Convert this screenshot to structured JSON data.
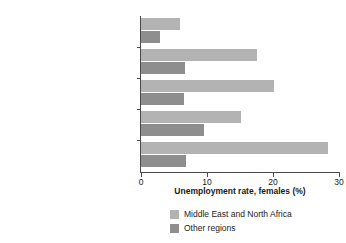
{
  "chart_data": {
    "type": "bar",
    "orientation": "horizontal",
    "title": "",
    "xlabel": "Unemployment rate, females (%)",
    "ylabel": "",
    "xlim": [
      0,
      30
    ],
    "xticks": [
      0,
      10,
      20,
      30
    ],
    "xtick_labels": [
      "0",
      "10",
      "20",
      "30"
    ],
    "grid": false,
    "legend_position": "bottom",
    "categories": [
      "No education",
      "Primary incomplete",
      "Primary complete",
      "Secondary complete",
      "Some tertiary or postsecondary"
    ],
    "series": [
      {
        "name": "Middle East and North Africa",
        "color": "#b3b3b3",
        "values": [
          5.9,
          17.6,
          20.2,
          15.1,
          28.4
        ]
      },
      {
        "name": "Other regions",
        "color": "#8e8e8e",
        "values": [
          2.9,
          6.7,
          6.5,
          9.5,
          6.8
        ]
      }
    ]
  }
}
